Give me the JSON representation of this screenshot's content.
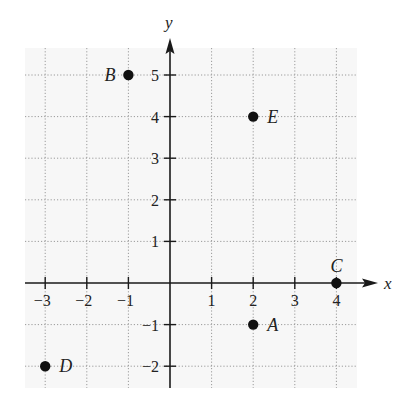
{
  "chart_data": {
    "type": "scatter",
    "title": "",
    "xlabel": "x",
    "ylabel": "y",
    "xlim": [
      -3,
      4
    ],
    "ylim": [
      -2,
      5
    ],
    "grid": true,
    "grid_style": "dotted",
    "x_ticks": [
      -3,
      -2,
      -1,
      1,
      2,
      3,
      4
    ],
    "y_ticks": [
      -2,
      -1,
      1,
      2,
      3,
      4,
      5
    ],
    "x_tick_labels": [
      "−3",
      "−2",
      "−1",
      "1",
      "2",
      "3",
      "4"
    ],
    "y_tick_labels": [
      "−2",
      "−1",
      "1",
      "2",
      "3",
      "4",
      "5"
    ],
    "points": [
      {
        "label": "A",
        "x": 2,
        "y": -1,
        "label_pos": "right"
      },
      {
        "label": "B",
        "x": -1,
        "y": 5,
        "label_pos": "left"
      },
      {
        "label": "C",
        "x": 4,
        "y": 0,
        "label_pos": "above"
      },
      {
        "label": "D",
        "x": -3,
        "y": -2,
        "label_pos": "right"
      },
      {
        "label": "E",
        "x": 2,
        "y": 4,
        "label_pos": "right"
      }
    ],
    "legend": null
  },
  "colors": {
    "grid_background": "#f7f7f7",
    "grid_line": "#9a9a9a",
    "axis": "#1a1a1a",
    "point": "#111111",
    "text": "#222222"
  }
}
